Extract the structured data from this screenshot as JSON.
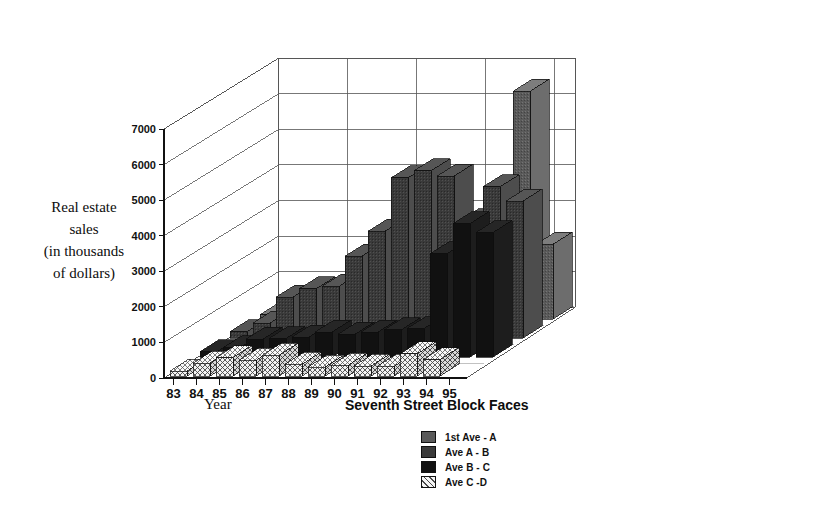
{
  "chart_data": {
    "type": "bar",
    "render": "3d-grouped-bar",
    "title": "",
    "ylabel": "Real estate sales (in thousands of dollars)",
    "ylabel_lines": [
      "Real estate",
      "sales",
      "(in thousands",
      "of dollars)"
    ],
    "xlabel": "Year",
    "zlabel": "Seventh Street Block Faces",
    "categories": [
      "83",
      "84",
      "85",
      "86",
      "87",
      "88",
      "89",
      "90",
      "91",
      "92",
      "93",
      "94",
      "95"
    ],
    "ylim": [
      0,
      7000
    ],
    "yticks": [
      0,
      1000,
      2000,
      3000,
      4000,
      5000,
      6000,
      7000
    ],
    "ytick_labels": [
      "0",
      "1000",
      "2000",
      "3000",
      "4000",
      "5000",
      "6000",
      "7000"
    ],
    "grid": true,
    "legend_position": "bottom-center",
    "series": [
      {
        "name": "1st Ave - A",
        "color": "#5a5a5a",
        "pattern": "solid-gray",
        "values": [
          120,
          300,
          820,
          640,
          980,
          520,
          260,
          300,
          260,
          240,
          1900,
          6400,
          2100
        ]
      },
      {
        "name": "Ave A - B",
        "color": "#3a3a3a",
        "pattern": "dark-gray",
        "values": [
          180,
          420,
          1150,
          1380,
          1450,
          2300,
          3000,
          4500,
          4700,
          4550,
          3300,
          4250,
          3850
        ]
      },
      {
        "name": "Ave B - C",
        "color": "#111111",
        "pattern": "black",
        "values": [
          150,
          260,
          500,
          520,
          560,
          700,
          640,
          700,
          760,
          800,
          2900,
          3750,
          3500
        ]
      },
      {
        "name": "Ave C -D",
        "color": "#ededed",
        "pattern": "cross-hatch",
        "values": [
          140,
          360,
          520,
          440,
          580,
          330,
          250,
          300,
          280,
          270,
          620,
          460,
          0
        ]
      }
    ]
  },
  "legend": {
    "items": [
      {
        "label": "1st Ave - A",
        "swatch": "#5a5a5a",
        "pattern": "solid-gray"
      },
      {
        "label": "Ave A - B",
        "swatch": "#3a3a3a",
        "pattern": "dark-gray"
      },
      {
        "label": "Ave B - C",
        "swatch": "#111111",
        "pattern": "black"
      },
      {
        "label": "Ave C -D",
        "swatch": "#ededed",
        "pattern": "cross-hatch"
      }
    ]
  },
  "axes": {
    "y_title_lines": [
      "Real estate",
      "sales",
      "(in thousands",
      "of dollars)"
    ],
    "x_title": "Year",
    "z_title": "Seventh Street Block Faces"
  }
}
